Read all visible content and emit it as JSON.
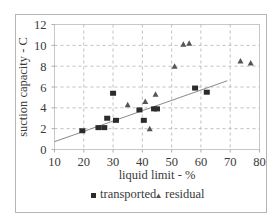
{
  "chart_data": {
    "type": "scatter",
    "title": "",
    "xlabel": "liquid limit - %",
    "ylabel": "suction capacity - C",
    "xlim": [
      10,
      80
    ],
    "ylim": [
      0,
      12
    ],
    "xticks": [
      10,
      20,
      30,
      40,
      50,
      60,
      70,
      80
    ],
    "yticks": [
      0,
      2,
      4,
      6,
      8,
      10,
      12
    ],
    "grid": true,
    "grid_style": "dashed",
    "legend_position": "bottom",
    "series": [
      {
        "name": "transported",
        "marker": "square",
        "color": "#2b2b2b",
        "points": [
          [
            19.5,
            1.8
          ],
          [
            25,
            2.1
          ],
          [
            27,
            2.1
          ],
          [
            28,
            3.0
          ],
          [
            30,
            5.4
          ],
          [
            31,
            2.8
          ],
          [
            39,
            3.8
          ],
          [
            40.5,
            2.8
          ],
          [
            44,
            3.9
          ],
          [
            45,
            3.9
          ],
          [
            58,
            5.9
          ],
          [
            62,
            5.5
          ]
        ]
      },
      {
        "name": "residual",
        "marker": "triangle",
        "color": "#555555",
        "points": [
          [
            35,
            4.3
          ],
          [
            41,
            4.6
          ],
          [
            42.5,
            2.0
          ],
          [
            44.5,
            5.3
          ],
          [
            51,
            8.0
          ],
          [
            54,
            10.1
          ],
          [
            56,
            10.2
          ],
          [
            73.5,
            8.5
          ],
          [
            77,
            8.3
          ]
        ]
      }
    ],
    "trendline": {
      "color": "#8a8a8a",
      "points": [
        [
          10,
          0.75
        ],
        [
          69,
          6.6
        ]
      ]
    }
  },
  "colors": {
    "frame": "#b5b5b5",
    "grid": "#b0b0b0",
    "text": "#3a3a3a"
  }
}
